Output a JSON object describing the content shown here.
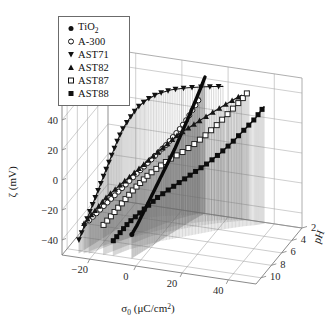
{
  "figure": {
    "kind": "3d-scatter-plot",
    "background": "#ffffff",
    "ink": "#000000"
  },
  "legend": {
    "name": "series-legend",
    "entries": [
      {
        "label": "TiO",
        "sub": "2",
        "marker": "filled-circle",
        "key": "TiO2"
      },
      {
        "label": "A-300",
        "sub": "",
        "marker": "open-circle",
        "key": "A-300"
      },
      {
        "label": "AST71",
        "sub": "",
        "marker": "filled-down-triangle",
        "key": "AST71"
      },
      {
        "label": "AST82",
        "sub": "",
        "marker": "filled-up-triangle",
        "key": "AST82"
      },
      {
        "label": "AST87",
        "sub": "",
        "marker": "open-square",
        "key": "AST87"
      },
      {
        "label": "AST88",
        "sub": "",
        "marker": "filled-square",
        "key": "AST88"
      }
    ]
  },
  "axes": {
    "y": {
      "label_main": "ζ (mV)",
      "ticks": [
        "40",
        "20",
        "0",
        "−20",
        "−40"
      ],
      "values": [
        40,
        20,
        0,
        -20,
        -40
      ],
      "range": [
        -50,
        50
      ]
    },
    "x": {
      "label_main": "σ",
      "label_sub": "0",
      "label_unit": "(μC/cm",
      "label_sup": "2",
      "label_close": ")",
      "ticks": [
        "−20",
        "0",
        "20",
        "40"
      ],
      "values": [
        -20,
        0,
        20,
        40
      ],
      "range": [
        -32,
        52
      ]
    },
    "z": {
      "label_main": "pH",
      "ticks": [
        "2",
        "4",
        "6",
        "8",
        "10"
      ],
      "values": [
        2,
        4,
        6,
        8,
        10
      ],
      "range": [
        2,
        11
      ]
    }
  },
  "chart_data": {
    "type": "scatter",
    "title": "",
    "xlabel": "σ0 (μC/cm2)",
    "ylabel": "ζ (mV)",
    "zlabel": "pH",
    "xlim": [
      -32,
      52
    ],
    "ylim": [
      -50,
      50
    ],
    "zlim": [
      2,
      11
    ],
    "grid": true,
    "legend_position": "upper-left",
    "projection": "3d-droplines",
    "note": "Zeta potential vs surface charge density across pH for six oxide samples; each point drops a vertical hairline to the base plane.",
    "series": [
      {
        "name": "TiO2",
        "marker": "filled-circle",
        "color": "#0a0a0a",
        "linewidth": 3.4,
        "points": [
          {
            "x": -4,
            "y": -34,
            "z": 10.0
          },
          {
            "x": -3,
            "y": -30,
            "z": 9.4
          },
          {
            "x": -2,
            "y": -25,
            "z": 8.8
          },
          {
            "x": -1,
            "y": -20,
            "z": 8.2
          },
          {
            "x": 0,
            "y": -15,
            "z": 7.6
          },
          {
            "x": 1,
            "y": -10,
            "z": 7.0
          },
          {
            "x": 2,
            "y": -5,
            "z": 6.4
          },
          {
            "x": 3,
            "y": 0,
            "z": 5.8
          },
          {
            "x": 4,
            "y": 5,
            "z": 5.2
          },
          {
            "x": 5,
            "y": 11,
            "z": 4.6
          },
          {
            "x": 6,
            "y": 17,
            "z": 4.0
          },
          {
            "x": 7,
            "y": 23,
            "z": 3.4
          },
          {
            "x": 8,
            "y": 29,
            "z": 2.9
          },
          {
            "x": 9,
            "y": 35,
            "z": 2.4
          },
          {
            "x": 10,
            "y": 41,
            "z": 2.0
          }
        ]
      },
      {
        "name": "A-300",
        "marker": "open-circle",
        "color": "#1c1c1c",
        "linewidth": 1.1,
        "points": [
          {
            "x": -22,
            "y": -28,
            "z": 10.2
          },
          {
            "x": -20,
            "y": -25,
            "z": 9.6
          },
          {
            "x": -18,
            "y": -22,
            "z": 9.0
          },
          {
            "x": -16,
            "y": -19,
            "z": 8.4
          },
          {
            "x": -14,
            "y": -16,
            "z": 7.8
          },
          {
            "x": -12,
            "y": -13,
            "z": 7.2
          },
          {
            "x": -10,
            "y": -10,
            "z": 6.6
          },
          {
            "x": -8,
            "y": -7,
            "z": 6.0
          },
          {
            "x": -6,
            "y": -4,
            "z": 5.4
          },
          {
            "x": -4,
            "y": -1,
            "z": 4.8
          },
          {
            "x": -2,
            "y": 2,
            "z": 4.2
          },
          {
            "x": 0,
            "y": 6,
            "z": 3.7
          },
          {
            "x": 2,
            "y": 10,
            "z": 3.2
          },
          {
            "x": 4,
            "y": 15,
            "z": 2.8
          },
          {
            "x": 6,
            "y": 21,
            "z": 2.4
          },
          {
            "x": 8,
            "y": 27,
            "z": 2.1
          }
        ]
      },
      {
        "name": "AST71",
        "marker": "filled-down-triangle",
        "color": "#121212",
        "linewidth": 1.1,
        "points": [
          {
            "x": -26,
            "y": -41,
            "z": 10.4
          },
          {
            "x": -25,
            "y": -34,
            "z": 9.8
          },
          {
            "x": -24,
            "y": -27,
            "z": 9.2
          },
          {
            "x": -23,
            "y": -20,
            "z": 8.6
          },
          {
            "x": -22,
            "y": -13,
            "z": 8.0
          },
          {
            "x": -21,
            "y": -6,
            "z": 7.4
          },
          {
            "x": -20,
            "y": 1,
            "z": 6.8
          },
          {
            "x": -19,
            "y": 8,
            "z": 6.2
          },
          {
            "x": -18,
            "y": 14,
            "z": 5.6
          },
          {
            "x": -16,
            "y": 20,
            "z": 5.0
          },
          {
            "x": -14,
            "y": 25,
            "z": 4.4
          },
          {
            "x": -11,
            "y": 29,
            "z": 3.9
          },
          {
            "x": -7,
            "y": 32,
            "z": 3.4
          },
          {
            "x": -2,
            "y": 34,
            "z": 3.0
          },
          {
            "x": 4,
            "y": 35,
            "z": 2.6
          },
          {
            "x": 11,
            "y": 36,
            "z": 2.3
          },
          {
            "x": 18,
            "y": 37,
            "z": 2.1
          }
        ]
      },
      {
        "name": "AST82",
        "marker": "filled-up-triangle",
        "color": "#161616",
        "linewidth": 1.1,
        "points": [
          {
            "x": -24,
            "y": -30,
            "z": 10.3
          },
          {
            "x": -22,
            "y": -26,
            "z": 9.7
          },
          {
            "x": -20,
            "y": -22,
            "z": 9.1
          },
          {
            "x": -18,
            "y": -18,
            "z": 8.5
          },
          {
            "x": -15,
            "y": -14,
            "z": 7.9
          },
          {
            "x": -12,
            "y": -10,
            "z": 7.3
          },
          {
            "x": -9,
            "y": -6,
            "z": 6.7
          },
          {
            "x": -6,
            "y": -2,
            "z": 6.1
          },
          {
            "x": -3,
            "y": 2,
            "z": 5.5
          },
          {
            "x": 0,
            "y": 6,
            "z": 4.9
          },
          {
            "x": 3,
            "y": 10,
            "z": 4.3
          },
          {
            "x": 7,
            "y": 14,
            "z": 3.8
          },
          {
            "x": 11,
            "y": 18,
            "z": 3.3
          },
          {
            "x": 16,
            "y": 23,
            "z": 2.8
          },
          {
            "x": 21,
            "y": 28,
            "z": 2.4
          },
          {
            "x": 26,
            "y": 33,
            "z": 2.1
          }
        ]
      },
      {
        "name": "AST87",
        "marker": "open-square",
        "color": "#222222",
        "linewidth": 1.1,
        "points": [
          {
            "x": -16,
            "y": -30,
            "z": 10.1
          },
          {
            "x": -14,
            "y": -26,
            "z": 9.5
          },
          {
            "x": -12,
            "y": -22,
            "z": 8.9
          },
          {
            "x": -10,
            "y": -18,
            "z": 8.3
          },
          {
            "x": -8,
            "y": -14,
            "z": 7.7
          },
          {
            "x": -6,
            "y": -11,
            "z": 7.1
          },
          {
            "x": -4,
            "y": -8,
            "z": 6.5
          },
          {
            "x": -1,
            "y": -5,
            "z": 5.9
          },
          {
            "x": 2,
            "y": -2,
            "z": 5.3
          },
          {
            "x": 6,
            "y": 1,
            "z": 4.7
          },
          {
            "x": 10,
            "y": 5,
            "z": 4.1
          },
          {
            "x": 14,
            "y": 10,
            "z": 3.6
          },
          {
            "x": 18,
            "y": 16,
            "z": 3.1
          },
          {
            "x": 22,
            "y": 23,
            "z": 2.7
          },
          {
            "x": 26,
            "y": 30,
            "z": 2.3
          },
          {
            "x": 29,
            "y": 36,
            "z": 2.0
          }
        ]
      },
      {
        "name": "AST88",
        "marker": "filled-square",
        "color": "#0d0d0d",
        "linewidth": 1.4,
        "points": [
          {
            "x": -12,
            "y": -40,
            "z": 10.0
          },
          {
            "x": -10,
            "y": -36,
            "z": 9.4
          },
          {
            "x": -8,
            "y": -32,
            "z": 8.8
          },
          {
            "x": -5,
            "y": -28,
            "z": 8.2
          },
          {
            "x": -2,
            "y": -24,
            "z": 7.6
          },
          {
            "x": 1,
            "y": -20,
            "z": 7.0
          },
          {
            "x": 5,
            "y": -16,
            "z": 6.4
          },
          {
            "x": 9,
            "y": -12,
            "z": 5.8
          },
          {
            "x": 13,
            "y": -8,
            "z": 5.2
          },
          {
            "x": 17,
            "y": -4,
            "z": 4.6
          },
          {
            "x": 21,
            "y": 1,
            "z": 4.0
          },
          {
            "x": 25,
            "y": 7,
            "z": 3.5
          },
          {
            "x": 29,
            "y": 14,
            "z": 3.0
          },
          {
            "x": 33,
            "y": 21,
            "z": 2.6
          },
          {
            "x": 36,
            "y": 28,
            "z": 2.2
          }
        ]
      }
    ]
  }
}
